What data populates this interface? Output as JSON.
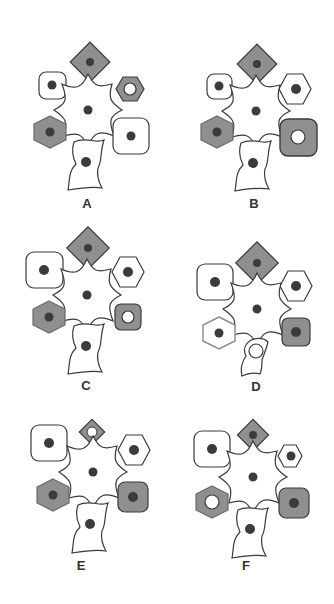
{
  "figure": {
    "colors": {
      "outline": "#3a3a3a",
      "white_fill": "#ffffff",
      "gray_fill": "#8f8f8f",
      "nucleus": "#3b3b3b",
      "open_nucleus_fill": "#ffffff"
    },
    "panels": [
      {
        "label": "A",
        "cells": {
          "top_diamond": {
            "fill": "gray",
            "nucleus": "dark",
            "size": "large"
          },
          "top_left_square": {
            "fill": "white",
            "nucleus": "dark",
            "size": "small"
          },
          "top_right_hexagon": {
            "fill": "gray",
            "nucleus": "open",
            "size": "small"
          },
          "center_star": {
            "fill": "white",
            "nucleus": "dark"
          },
          "bottom_left_hexagon": {
            "fill": "gray",
            "nucleus": "dark",
            "size": "large"
          },
          "bottom_right_square": {
            "fill": "white",
            "nucleus": "dark",
            "size": "large"
          },
          "bottom_cell": {
            "fill": "white",
            "nucleus": "dark",
            "size": "large"
          }
        }
      },
      {
        "label": "B",
        "cells": {
          "top_diamond": {
            "fill": "gray",
            "nucleus": "dark",
            "size": "large"
          },
          "top_left_square": {
            "fill": "white",
            "nucleus": "dark",
            "size": "small"
          },
          "top_right_hexagon": {
            "fill": "white",
            "nucleus": "dark",
            "size": "large"
          },
          "center_star": {
            "fill": "white",
            "nucleus": "dark"
          },
          "bottom_left_hexagon": {
            "fill": "gray",
            "nucleus": "dark",
            "size": "large"
          },
          "bottom_right_square": {
            "fill": "gray",
            "nucleus": "open",
            "size": "large"
          },
          "bottom_cell": {
            "fill": "white",
            "nucleus": "dark",
            "size": "large"
          }
        }
      },
      {
        "label": "C",
        "cells": {
          "top_diamond": {
            "fill": "gray",
            "nucleus": "dark",
            "size": "large"
          },
          "top_left_square": {
            "fill": "white",
            "nucleus": "dark",
            "size": "large"
          },
          "top_right_hexagon": {
            "fill": "white",
            "nucleus": "dark",
            "size": "large"
          },
          "center_star": {
            "fill": "white",
            "nucleus": "dark"
          },
          "bottom_left_hexagon": {
            "fill": "gray",
            "nucleus": "dark",
            "size": "large"
          },
          "bottom_right_square": {
            "fill": "gray",
            "nucleus": "open",
            "size": "small"
          },
          "bottom_cell": {
            "fill": "white",
            "nucleus": "dark",
            "size": "large"
          }
        }
      },
      {
        "label": "D",
        "cells": {
          "top_diamond": {
            "fill": "gray",
            "nucleus": "dark",
            "size": "large"
          },
          "top_left_square": {
            "fill": "white",
            "nucleus": "dark",
            "size": "large"
          },
          "top_right_hexagon": {
            "fill": "white",
            "nucleus": "dark",
            "size": "large"
          },
          "center_star": {
            "fill": "white",
            "nucleus": "dark"
          },
          "bottom_left_hexagon": {
            "fill": "white",
            "nucleus": "dark",
            "size": "large"
          },
          "bottom_right_square": {
            "fill": "gray",
            "nucleus": "dark",
            "size": "large"
          },
          "bottom_cell": {
            "fill": "white",
            "nucleus": "open",
            "size": "small"
          }
        }
      },
      {
        "label": "E",
        "cells": {
          "top_diamond": {
            "fill": "gray",
            "nucleus": "open",
            "size": "small"
          },
          "top_left_square": {
            "fill": "white",
            "nucleus": "dark",
            "size": "large"
          },
          "top_right_hexagon": {
            "fill": "white",
            "nucleus": "dark",
            "size": "large"
          },
          "center_star": {
            "fill": "white",
            "nucleus": "dark"
          },
          "bottom_left_hexagon": {
            "fill": "gray",
            "nucleus": "dark",
            "size": "large"
          },
          "bottom_right_square": {
            "fill": "gray",
            "nucleus": "dark",
            "size": "large"
          },
          "bottom_cell": {
            "fill": "white",
            "nucleus": "dark",
            "size": "large"
          }
        }
      },
      {
        "label": "F",
        "cells": {
          "top_diamond": {
            "fill": "gray",
            "nucleus": "dark",
            "size": "small"
          },
          "top_left_square": {
            "fill": "white",
            "nucleus": "dark",
            "size": "large"
          },
          "top_right_hexagon": {
            "fill": "white",
            "nucleus": "dark",
            "size": "small"
          },
          "center_star": {
            "fill": "white",
            "nucleus": "dark"
          },
          "bottom_left_hexagon": {
            "fill": "gray",
            "nucleus": "open",
            "size": "large"
          },
          "bottom_right_square": {
            "fill": "gray",
            "nucleus": "dark",
            "size": "large"
          },
          "bottom_cell": {
            "fill": "white",
            "nucleus": "dark",
            "size": "large"
          }
        }
      }
    ]
  }
}
